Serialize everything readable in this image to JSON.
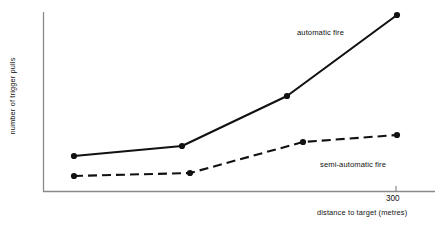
{
  "chart_data": {
    "type": "line",
    "title": "",
    "xlabel": "distance to target (metres)",
    "ylabel": "number of trigger pulls",
    "xlim": [
      0,
      360
    ],
    "ylim": [
      0,
      100
    ],
    "grid": false,
    "legend_position": "inline-annotations",
    "x_ticks": [
      {
        "label": "300",
        "value": 300
      }
    ],
    "y_ticks": [],
    "series": [
      {
        "name": "automatic fire",
        "style": "solid",
        "color": "#111111",
        "marker": "filled-circle",
        "x": [
          20,
          100,
          200,
          300
        ],
        "values": [
          21,
          27,
          56,
          101
        ],
        "points_px": [
          {
            "x": 74,
            "y": 156
          },
          {
            "x": 182,
            "y": 146
          },
          {
            "x": 287,
            "y": 96
          },
          {
            "x": 397,
            "y": 15
          }
        ]
      },
      {
        "name": "semi-automatic fire",
        "style": "dashed",
        "color": "#111111",
        "marker": "filled-circle",
        "x": [
          20,
          107,
          144,
          300
        ],
        "values": [
          10,
          12,
          29,
          33
        ],
        "points_px": [
          {
            "x": 74,
            "y": 176
          },
          {
            "x": 190,
            "y": 173
          },
          {
            "x": 303,
            "y": 142
          },
          {
            "x": 397,
            "y": 135
          }
        ]
      }
    ],
    "annotations": [
      {
        "text": "automatic fire",
        "x_px": 297,
        "y_px": 33
      },
      {
        "text": "semi-automatic fire",
        "x_px": 320,
        "y_px": 165
      }
    ],
    "axes_px": {
      "origin_x": 43,
      "origin_y": 192,
      "y_top": 12,
      "x_right": 435,
      "tick_300_x": 396,
      "axis_color": "#8a8a8a"
    }
  }
}
